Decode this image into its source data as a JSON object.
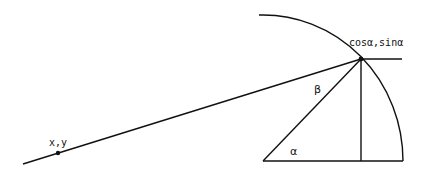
{
  "diagram": {
    "type": "geometry",
    "labels": {
      "point_far": "x,y",
      "point_circle": "cosα,sinα",
      "angle_alpha": "α",
      "angle_beta": "β"
    },
    "colors": {
      "stroke": "#111111",
      "background": "#ffffff"
    }
  }
}
